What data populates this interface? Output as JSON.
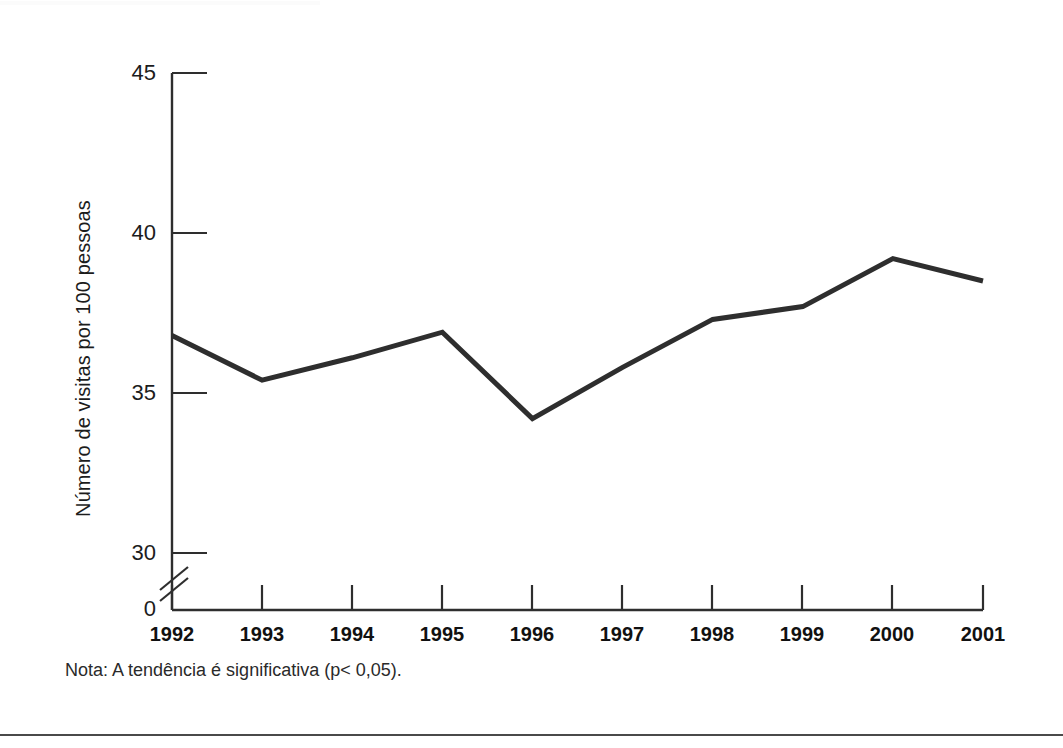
{
  "figure": {
    "note": "Nota: A tendência é significativa (p< 0,05).",
    "frame_color": "#3a3a3a",
    "line_color": "#2e2e2e",
    "background": "#ffffff"
  },
  "chart_data": {
    "type": "line",
    "title": "",
    "xlabel": "",
    "ylabel": "Número de visitas por 100 pessoas",
    "categories": [
      "1992",
      "1993",
      "1994",
      "1995",
      "1996",
      "1997",
      "1998",
      "1999",
      "2000",
      "2001"
    ],
    "values": [
      36.8,
      35.4,
      36.1,
      36.9,
      34.2,
      35.8,
      37.3,
      37.7,
      39.2,
      38.5
    ],
    "series": [
      {
        "name": "Número de visitas por 100 pessoas",
        "values": [
          36.8,
          35.4,
          36.1,
          36.9,
          34.2,
          35.8,
          37.3,
          37.7,
          39.2,
          38.5
        ]
      }
    ],
    "ylim": [
      30,
      45
    ],
    "yticks": [
      30,
      35,
      40,
      45
    ],
    "ytick_labels": [
      "30",
      "35",
      "40",
      "45"
    ],
    "y_zero_label": "0",
    "y_axis_break": true,
    "xlim": [
      "1992",
      "2001"
    ],
    "grid": false,
    "legend": "none",
    "annotations": [
      "Nota: A tendência é significativa (p< 0,05)."
    ]
  },
  "axis": {
    "y_title": "Número de visitas por 100 pessoas",
    "y_labels": [
      "45",
      "40",
      "35",
      "30",
      "0"
    ],
    "x_labels": [
      "1992",
      "1993",
      "1994",
      "1995",
      "1996",
      "1997",
      "1998",
      "1999",
      "2000",
      "2001"
    ]
  }
}
